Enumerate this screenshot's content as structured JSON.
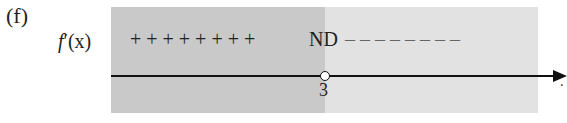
{
  "part_label": "(f)",
  "row_label": {
    "f": "f",
    "prime": "′",
    "arg": "(x)"
  },
  "left_signs": "+ + + + + + + +",
  "critical_marker": "ND",
  "right_signs": "– – – – – – – –",
  "critical_point": "3",
  "axis_end_label": ".",
  "colors": {
    "left_region": "#c9c9c9",
    "right_region": "#e2e2e2"
  }
}
